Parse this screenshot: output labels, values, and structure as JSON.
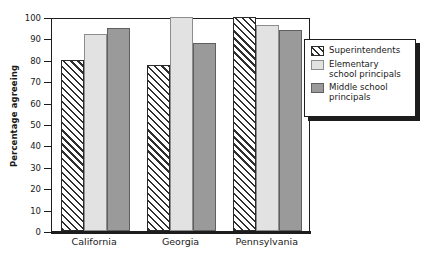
{
  "chart_data": {
    "type": "bar",
    "title": "",
    "subtitle": "",
    "xlabel": "",
    "ylabel": "Percentage agreeing",
    "ylim": [
      0,
      100
    ],
    "yticks": [
      0,
      10,
      20,
      30,
      40,
      50,
      60,
      70,
      80,
      90,
      100
    ],
    "ytick_labels": [
      "0",
      "10",
      "20",
      "30",
      "40",
      "50",
      "60",
      "70",
      "80",
      "90",
      "100"
    ],
    "grid": false,
    "legend_position": "right",
    "categories": [
      "California",
      "Georgia",
      "Pennsylvania"
    ],
    "series": [
      {
        "name": "Superintendents",
        "swatch": "diagonal-hatch",
        "color": "#ffffff",
        "values": [
          80,
          77.5,
          100
        ]
      },
      {
        "name": "Elementary school principals",
        "swatch": "light-gray",
        "color": "#e2e2e2",
        "values": [
          92,
          100,
          96.5
        ]
      },
      {
        "name": "Middle school principals",
        "swatch": "medium-gray",
        "color": "#9a9a9a",
        "values": [
          95,
          88,
          94
        ]
      }
    ],
    "annotations": []
  },
  "legend": {
    "entries": [
      {
        "label": "Superintendents"
      },
      {
        "label": "Elementary\nschool principals"
      },
      {
        "label": "Middle school\nprincipals"
      }
    ]
  },
  "axis": {
    "y_title": "Percentage agreeing"
  }
}
